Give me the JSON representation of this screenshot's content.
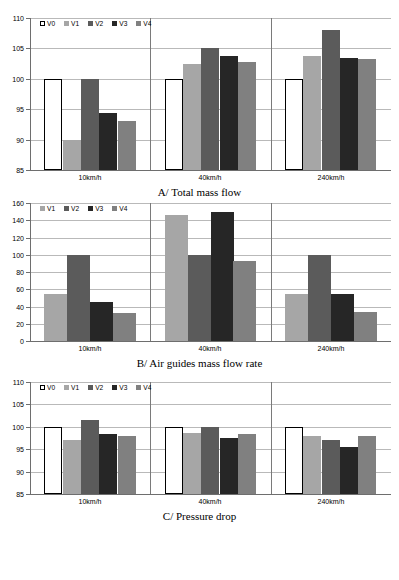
{
  "figure": {
    "background": "#ffffff",
    "series_colors": {
      "V0": "#ffffff",
      "V1": "#a6a6a6",
      "V2": "#5b5b5b",
      "V3": "#262626",
      "V4": "#808080"
    },
    "series_border": "#000000",
    "grid_color": "#b9b9b9",
    "axis_color": "#6e6e6e"
  },
  "chart_data": [
    {
      "type": "bar",
      "id": "chart-a",
      "title": "A/ Total mass flow",
      "xlabel": "",
      "ylabel": "",
      "categories": [
        "10km/h",
        "40km/h",
        "240km/h"
      ],
      "ylim": [
        85,
        110
      ],
      "yticks": [
        85,
        90,
        95,
        100,
        105,
        110
      ],
      "grid": true,
      "legend_position": "top-left",
      "legend": [
        "V0",
        "V1",
        "V2",
        "V3",
        "V4"
      ],
      "series": [
        {
          "name": "V0",
          "values": [
            100,
            100,
            100
          ]
        },
        {
          "name": "V1",
          "values": [
            90,
            102.5,
            103.7
          ]
        },
        {
          "name": "V2",
          "values": [
            100,
            105,
            108
          ]
        },
        {
          "name": "V3",
          "values": [
            94.3,
            103.8,
            103.4
          ]
        },
        {
          "name": "V4",
          "values": [
            93,
            102.8,
            103.2
          ]
        }
      ]
    },
    {
      "type": "bar",
      "id": "chart-b",
      "title": "B/ Air guides mass flow rate",
      "xlabel": "",
      "ylabel": "",
      "categories": [
        "10km/h",
        "40km/h",
        "240km/h"
      ],
      "ylim": [
        0,
        160
      ],
      "yticks": [
        0,
        20,
        40,
        60,
        80,
        100,
        120,
        140,
        160
      ],
      "grid": true,
      "legend_position": "top-left",
      "legend": [
        "V1",
        "V2",
        "V3",
        "V4"
      ],
      "series": [
        {
          "name": "V1",
          "values": [
            55,
            146,
            54
          ]
        },
        {
          "name": "V2",
          "values": [
            100,
            100,
            100
          ]
        },
        {
          "name": "V3",
          "values": [
            45.5,
            149,
            54
          ]
        },
        {
          "name": "V4",
          "values": [
            32,
            93,
            33.5
          ]
        }
      ]
    },
    {
      "type": "bar",
      "id": "chart-c",
      "title": "C/ Pressure drop",
      "xlabel": "",
      "ylabel": "",
      "categories": [
        "10km/h",
        "40km/h",
        "240km/h"
      ],
      "ylim": [
        85,
        110
      ],
      "yticks": [
        85,
        90,
        95,
        100,
        105,
        110
      ],
      "grid": true,
      "legend_position": "top-left",
      "legend": [
        "V0",
        "V1",
        "V2",
        "V3",
        "V4"
      ],
      "series": [
        {
          "name": "V0",
          "values": [
            100,
            100,
            100
          ]
        },
        {
          "name": "V1",
          "values": [
            97,
            98.6,
            98
          ]
        },
        {
          "name": "V2",
          "values": [
            101.6,
            100,
            97
          ]
        },
        {
          "name": "V3",
          "values": [
            98.3,
            97.6,
            95.6
          ]
        },
        {
          "name": "V4",
          "values": [
            97.9,
            98.4,
            98
          ]
        }
      ]
    }
  ]
}
